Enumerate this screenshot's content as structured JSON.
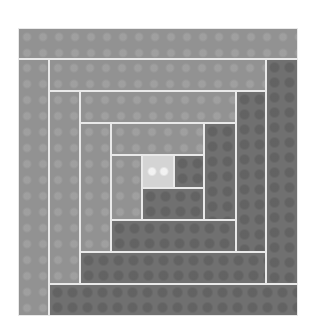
{
  "image": {
    "subject": "log cabin quilt block",
    "background": "#ffffff"
  },
  "colors": {
    "light_log": "#929292",
    "dark_log": "#707070",
    "center": "#d4d4d4",
    "seam": "#e9e9e9"
  },
  "pieces": [
    {
      "name": "center-square",
      "tone": "center",
      "x": 142,
      "y": 155,
      "w": 32,
      "h": 33
    },
    {
      "name": "round1-right",
      "tone": "dark",
      "x": 174,
      "y": 155,
      "w": 30,
      "h": 33
    },
    {
      "name": "round1-bottom",
      "tone": "dark",
      "x": 142,
      "y": 188,
      "w": 62,
      "h": 32
    },
    {
      "name": "round1-left",
      "tone": "light",
      "x": 111,
      "y": 155,
      "w": 31,
      "h": 65
    },
    {
      "name": "round1-top",
      "tone": "light",
      "x": 111,
      "y": 123,
      "w": 93,
      "h": 32
    },
    {
      "name": "round2-right",
      "tone": "dark",
      "x": 204,
      "y": 123,
      "w": 32,
      "h": 97
    },
    {
      "name": "round2-bottom",
      "tone": "dark",
      "x": 111,
      "y": 220,
      "w": 125,
      "h": 32
    },
    {
      "name": "round2-left",
      "tone": "light",
      "x": 80,
      "y": 123,
      "w": 31,
      "h": 129
    },
    {
      "name": "round2-top",
      "tone": "light",
      "x": 80,
      "y": 91,
      "w": 156,
      "h": 32
    },
    {
      "name": "round3-right",
      "tone": "dark",
      "x": 236,
      "y": 91,
      "w": 30,
      "h": 161
    },
    {
      "name": "round3-bottom",
      "tone": "dark",
      "x": 80,
      "y": 252,
      "w": 186,
      "h": 32
    },
    {
      "name": "round3-left",
      "tone": "light",
      "x": 49,
      "y": 91,
      "w": 31,
      "h": 193
    },
    {
      "name": "round3-top",
      "tone": "light",
      "x": 49,
      "y": 59,
      "w": 217,
      "h": 32
    },
    {
      "name": "round4-right",
      "tone": "dark",
      "x": 266,
      "y": 59,
      "w": 32,
      "h": 225
    },
    {
      "name": "round4-bottom",
      "tone": "dark",
      "x": 49,
      "y": 284,
      "w": 249,
      "h": 32
    },
    {
      "name": "round4-left",
      "tone": "light",
      "x": 18,
      "y": 59,
      "w": 31,
      "h": 257
    },
    {
      "name": "round4-top",
      "tone": "light",
      "x": 18,
      "y": 28,
      "w": 280,
      "h": 31
    }
  ]
}
